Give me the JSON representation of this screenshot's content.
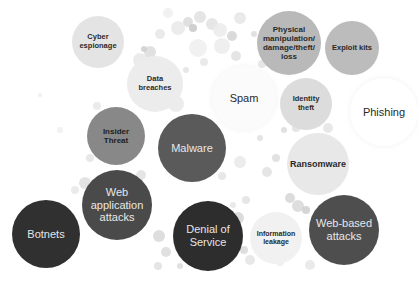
{
  "diagram": {
    "type": "bubble-cloud",
    "bubbles": [
      {
        "id": "cyber-espionage",
        "label": "Cyber espionage",
        "cx": 98,
        "cy": 42,
        "r": 26,
        "fill": "#e4e4e4",
        "text": "#2a2a2a",
        "size": 7.5,
        "weight": "bold"
      },
      {
        "id": "data-breaches",
        "label": "Data breaches",
        "cx": 155,
        "cy": 84,
        "r": 28,
        "fill": "#ececec",
        "text": "#2a2a2a",
        "size": 7.5,
        "weight": "bold"
      },
      {
        "id": "physical-manipulation",
        "label": "Physical manipulation/ damage/theft/ loss",
        "cx": 289,
        "cy": 43,
        "r": 32,
        "fill": "#b9b9b9",
        "text": "#2a2a2a",
        "size": 8,
        "weight": "bold"
      },
      {
        "id": "exploit-kits",
        "label": "Exploit kits",
        "cx": 352,
        "cy": 48,
        "r": 27,
        "fill": "#bcbcbc",
        "text": "#2a2a2a",
        "size": 7.5,
        "weight": "bold"
      },
      {
        "id": "spam",
        "label": "Spam",
        "cx": 244,
        "cy": 98,
        "r": 32,
        "fill": "#fbfbfb",
        "text": "#2a2a2a",
        "size": 11,
        "weight": "normal"
      },
      {
        "id": "identity-theft",
        "label": "Identity theft",
        "cx": 306,
        "cy": 104,
        "r": 26,
        "fill": "#dcdcdc",
        "text": "#2a2a2a",
        "size": 7.5,
        "weight": "bold"
      },
      {
        "id": "phishing",
        "label": "Phishing",
        "cx": 384,
        "cy": 112,
        "r": 34,
        "fill": "#ffffff",
        "text": "#2a2a2a",
        "size": 11,
        "weight": "normal"
      },
      {
        "id": "insider-threat",
        "label": "Insider Threat",
        "cx": 116,
        "cy": 136,
        "r": 29,
        "fill": "#888888",
        "text": "#202020",
        "size": 8,
        "weight": "bold"
      },
      {
        "id": "malware",
        "label": "Malware",
        "cx": 192,
        "cy": 148,
        "r": 34,
        "fill": "#5a5a5a",
        "text": "#e8e8e8",
        "size": 11,
        "weight": "normal"
      },
      {
        "id": "ransomware",
        "label": "Ransomware",
        "cx": 318,
        "cy": 164,
        "r": 31,
        "fill": "#e8e8e8",
        "text": "#2a2a2a",
        "size": 9,
        "weight": "bold"
      },
      {
        "id": "web-application-attacks",
        "label": "Web application attacks",
        "cx": 117,
        "cy": 205,
        "r": 35,
        "fill": "#4a4a4a",
        "text": "#e8e8e8",
        "size": 11,
        "weight": "normal"
      },
      {
        "id": "botnets",
        "label": "Botnets",
        "cx": 46,
        "cy": 234,
        "r": 34,
        "fill": "#303030",
        "text": "#e6e6e6",
        "size": 11,
        "weight": "normal"
      },
      {
        "id": "denial-of-service",
        "label": "Denial of Service",
        "cx": 208,
        "cy": 236,
        "r": 35,
        "fill": "#2d2d2d",
        "text": "#e6e6e6",
        "size": 11,
        "weight": "normal"
      },
      {
        "id": "information-leakage",
        "label": "Information leakage",
        "cx": 276,
        "cy": 238,
        "r": 26,
        "fill": "#f1f1f1",
        "text": "#2a2a2a",
        "size": 7,
        "weight": "bold"
      },
      {
        "id": "web-based-attacks",
        "label": "Web-based attacks",
        "cx": 344,
        "cy": 230,
        "r": 35,
        "fill": "#4e4e4e",
        "text": "#e8e8e8",
        "size": 11,
        "weight": "normal"
      }
    ],
    "decor_dots": [
      [
        150,
        52,
        6,
        "#dcdcdc"
      ],
      [
        160,
        34,
        5,
        "#e6e6e6"
      ],
      [
        178,
        28,
        7,
        "#e9e9e9"
      ],
      [
        188,
        22,
        5,
        "#dadada"
      ],
      [
        200,
        17,
        6,
        "#e1e1e1"
      ],
      [
        193,
        28,
        4,
        "#c8c8c8"
      ],
      [
        212,
        24,
        6,
        "#e2e2e2"
      ],
      [
        220,
        30,
        7,
        "#ebebeb"
      ],
      [
        222,
        46,
        8,
        "#ececec"
      ],
      [
        232,
        36,
        5,
        "#d4d4d4"
      ],
      [
        240,
        18,
        6,
        "#e6e6e6"
      ],
      [
        236,
        56,
        5,
        "#e0e0e0"
      ],
      [
        198,
        48,
        9,
        "#efefef"
      ],
      [
        204,
        62,
        4,
        "#e6e6e6"
      ],
      [
        186,
        70,
        3,
        "#e3e3e3"
      ],
      [
        140,
        60,
        7,
        "#e7e7e7"
      ],
      [
        144,
        49,
        3,
        "#cfcfcf"
      ],
      [
        168,
        13,
        5,
        "#efefef"
      ],
      [
        254,
        34,
        3,
        "#dcdcdc"
      ],
      [
        244,
        74,
        6,
        "#ececec"
      ],
      [
        176,
        104,
        8,
        "#e9e9e9"
      ],
      [
        97,
        106,
        4,
        "#e7e7e7"
      ],
      [
        90,
        158,
        4,
        "#e4e4e4"
      ],
      [
        85,
        183,
        6,
        "#dedede"
      ],
      [
        141,
        175,
        5,
        "#e0e0e0"
      ],
      [
        159,
        236,
        6,
        "#d8d8d8"
      ],
      [
        166,
        252,
        5,
        "#dadada"
      ],
      [
        158,
        266,
        4,
        "#e0e0e0"
      ],
      [
        180,
        266,
        3,
        "#dcdcdc"
      ],
      [
        238,
        218,
        6,
        "#d6d6d6"
      ],
      [
        236,
        232,
        5,
        "#dcdcdc"
      ],
      [
        244,
        250,
        4,
        "#d8d8d8"
      ],
      [
        250,
        260,
        5,
        "#e4e4e4"
      ],
      [
        246,
        200,
        4,
        "#e2e2e2"
      ],
      [
        233,
        205,
        3,
        "#e6e6e6"
      ],
      [
        267,
        172,
        5,
        "#e1e1e1"
      ],
      [
        276,
        158,
        4,
        "#dcdcdc"
      ],
      [
        290,
        198,
        5,
        "#d6d6d6"
      ],
      [
        298,
        206,
        6,
        "#d8d8d8"
      ],
      [
        306,
        210,
        4,
        "#cecece"
      ],
      [
        258,
        120,
        4,
        "#e8e8e8"
      ],
      [
        260,
        138,
        3,
        "#e0e0e0"
      ],
      [
        228,
        114,
        5,
        "#e4e4e4"
      ],
      [
        284,
        130,
        3,
        "#dcdcdc"
      ],
      [
        296,
        128,
        4,
        "#e0e0e0"
      ],
      [
        328,
        128,
        5,
        "#e4e4e4"
      ],
      [
        240,
        162,
        6,
        "#e9e9e9"
      ],
      [
        222,
        176,
        4,
        "#e3e3e3"
      ],
      [
        280,
        262,
        4,
        "#ececec"
      ],
      [
        310,
        265,
        5,
        "#e6e6e6"
      ],
      [
        60,
        130,
        3,
        "#f0f0f0"
      ],
      [
        75,
        190,
        4,
        "#e7e7e7"
      ],
      [
        40,
        95,
        2,
        "#ededed"
      ],
      [
        226,
        88,
        5,
        "#e5e5e5"
      ],
      [
        262,
        64,
        4,
        "#e2e2e2"
      ]
    ]
  }
}
